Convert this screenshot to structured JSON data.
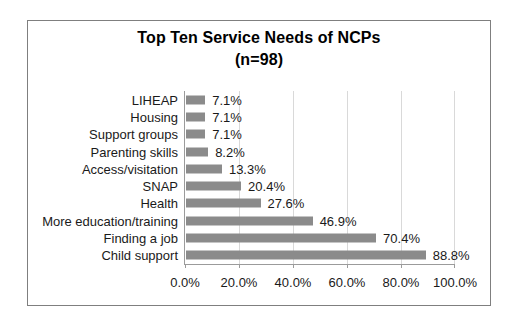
{
  "chart": {
    "title": "Top Ten Service Needs of NCPs",
    "subtitle": "(n=98)"
  },
  "chart_data": {
    "type": "bar",
    "orientation": "horizontal",
    "title": "Top Ten Service Needs of NCPs",
    "subtitle": "(n=98)",
    "categories": [
      "LIHEAP",
      "Housing",
      "Support groups",
      "Parenting skills",
      "Access/visitation",
      "SNAP",
      "Health",
      "More education/training",
      "Finding a job",
      "Child support"
    ],
    "values": [
      7.1,
      7.1,
      7.1,
      8.2,
      13.3,
      20.4,
      27.6,
      46.9,
      70.4,
      88.8
    ],
    "value_labels": [
      "7.1%",
      "7.1%",
      "7.1%",
      "8.2%",
      "13.3%",
      "20.4%",
      "27.6%",
      "46.9%",
      "70.4%",
      "88.8%"
    ],
    "xlabel": "",
    "ylabel": "",
    "xlim": [
      0,
      100
    ],
    "x_ticks": [
      0,
      20,
      40,
      60,
      80,
      100
    ],
    "x_tick_labels": [
      "0.0%",
      "20.0%",
      "40.0%",
      "60.0%",
      "80.0%",
      "100.0%"
    ],
    "grid": "vertical-major",
    "legend": "none"
  },
  "colors": {
    "bar": "#8b8b8b",
    "gridline": "#d9d9d9",
    "axis": "#9b9b9b",
    "frame_border": "#7f7f7f",
    "text": "#1a1a1a",
    "background": "#ffffff"
  }
}
